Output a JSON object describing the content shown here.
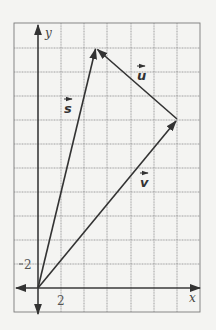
{
  "diagram": {
    "type": "vector-coordinate-grid",
    "grid_unit": 2,
    "axes": {
      "x_label": "x",
      "y_label": "y",
      "x_tick_label": "2",
      "y_tick_label": "2"
    },
    "vectors": [
      {
        "name": "s",
        "label": "s",
        "from": [
          0,
          0
        ],
        "to": [
          5,
          20
        ]
      },
      {
        "name": "v",
        "label": "v",
        "from": [
          0,
          0
        ],
        "to": [
          12,
          14
        ]
      },
      {
        "name": "u",
        "label": "u",
        "from": [
          12,
          14
        ],
        "to": [
          5,
          20
        ]
      }
    ],
    "colors": {
      "background": "#f4f4f2",
      "grid": "#8a8a8a",
      "ink": "#333333"
    }
  }
}
